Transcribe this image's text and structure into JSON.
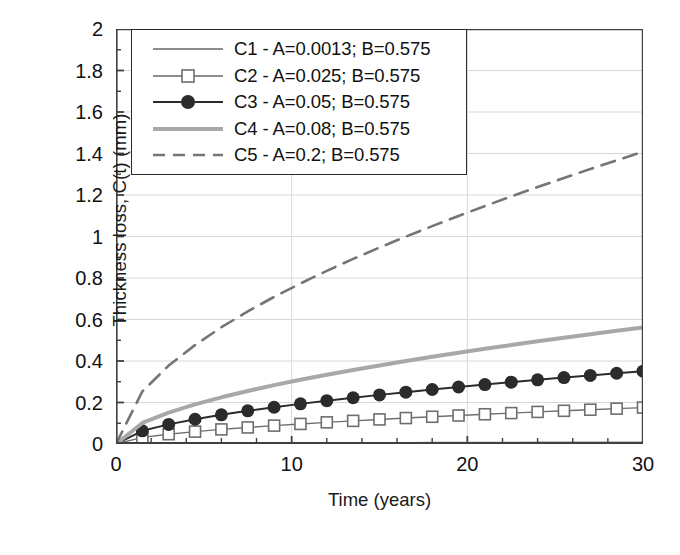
{
  "chart_data": {
    "type": "line",
    "title": "",
    "xlabel": "Time (years)",
    "ylabel": "Thickness loss, C(t) (mm)",
    "xlim": [
      0,
      30
    ],
    "ylim": [
      0,
      2
    ],
    "xticks": [
      0,
      10,
      20,
      30
    ],
    "xticklabels": [
      "0",
      "10",
      "20",
      "30"
    ],
    "xminor_step": 2,
    "yticks": [
      0,
      0.2,
      0.4,
      0.6,
      0.8,
      1,
      1.2,
      1.4,
      1.6,
      1.8,
      2
    ],
    "yticklabels": [
      "0",
      "0.2",
      "0.4",
      "0.6",
      "0.8",
      "1",
      "1.2",
      "1.4",
      "1.6",
      "1.8",
      "2"
    ],
    "yminor_step": 0.1,
    "grid": "horizontal gridlines at every 0.2; vertical gridlines at 10 and 20",
    "legend_position": "upper left inside axes",
    "model": "C(t) = A * t^B",
    "series": [
      {
        "name": "C1",
        "label": "C1 - A=0.0013; B=0.575",
        "A": 0.0013,
        "B": 0.575,
        "color": "#8c8c8c",
        "linewidth": 1.6,
        "dash": "none",
        "marker": "none",
        "x": [
          0,
          1.5,
          3,
          4.5,
          6,
          7.5,
          9,
          10.5,
          12,
          13.5,
          15,
          16.5,
          18,
          19.5,
          21,
          22.5,
          24,
          25.5,
          27,
          28.5,
          30
        ],
        "y": [
          0,
          0.0016,
          0.0024,
          0.0031,
          0.0036,
          0.0041,
          0.0045,
          0.0049,
          0.0053,
          0.0056,
          0.006,
          0.0063,
          0.0066,
          0.0069,
          0.0072,
          0.0074,
          0.0077,
          0.008,
          0.0082,
          0.0084,
          0.0087
        ]
      },
      {
        "name": "C2",
        "label": "C2 - A=0.025; B=0.575",
        "A": 0.025,
        "B": 0.575,
        "color": "#6e6e6e",
        "linewidth": 1.4,
        "dash": "none",
        "marker": "open-square",
        "x": [
          0,
          1.5,
          3,
          4.5,
          6,
          7.5,
          9,
          10.5,
          12,
          13.5,
          15,
          16.5,
          18,
          19.5,
          21,
          22.5,
          24,
          25.5,
          27,
          28.5,
          30
        ],
        "y": [
          0,
          0.0317,
          0.0473,
          0.0596,
          0.0703,
          0.0798,
          0.0886,
          0.0967,
          0.1043,
          0.1115,
          0.1184,
          0.125,
          0.1313,
          0.1374,
          0.1433,
          0.149,
          0.1546,
          0.16,
          0.1652,
          0.1704,
          0.1754
        ]
      },
      {
        "name": "C3",
        "label": "C3 -  A=0.05; B=0.575",
        "A": 0.05,
        "B": 0.575,
        "color": "#2b2b2b",
        "linewidth": 2.0,
        "dash": "none",
        "marker": "filled-circle",
        "x": [
          0,
          1.5,
          3,
          4.5,
          6,
          7.5,
          9,
          10.5,
          12,
          13.5,
          15,
          16.5,
          18,
          19.5,
          21,
          22.5,
          24,
          25.5,
          27,
          28.5,
          30
        ],
        "y": [
          0,
          0.0634,
          0.0945,
          0.1192,
          0.1406,
          0.1597,
          0.1772,
          0.1934,
          0.2086,
          0.223,
          0.2367,
          0.2499,
          0.2626,
          0.2748,
          0.2866,
          0.2981,
          0.3092,
          0.3201,
          0.3307,
          0.341,
          0.3511
        ]
      },
      {
        "name": "C4",
        "label": "C4 - A=0.08; B=0.575",
        "A": 0.08,
        "B": 0.575,
        "color": "#a8a8a8",
        "linewidth": 4.0,
        "dash": "none",
        "marker": "none",
        "x": [
          0,
          1.5,
          3,
          4.5,
          6,
          7.5,
          9,
          10.5,
          12,
          13.5,
          15,
          16.5,
          18,
          19.5,
          21,
          22.5,
          24,
          25.5,
          27,
          28.5,
          30
        ],
        "y": [
          0,
          0.1014,
          0.1512,
          0.1907,
          0.225,
          0.2556,
          0.2836,
          0.3095,
          0.3338,
          0.3568,
          0.3787,
          0.3998,
          0.4201,
          0.4397,
          0.4586,
          0.477,
          0.4948,
          0.5122,
          0.5291,
          0.5457,
          0.5618
        ]
      },
      {
        "name": "C5",
        "label": "C5 - A=0.2; B=0.575",
        "A": 0.2,
        "B": 0.575,
        "color": "#757575",
        "linewidth": 2.6,
        "dash": "14,9",
        "marker": "none",
        "x": [
          0,
          1.5,
          3,
          4.5,
          6,
          7.5,
          9,
          10.5,
          12,
          13.5,
          15,
          16.5,
          18,
          19.5,
          21,
          22.5,
          24,
          25.5,
          27,
          28.5,
          30
        ],
        "y": [
          0,
          0.2535,
          0.3779,
          0.4767,
          0.5625,
          0.639,
          0.7089,
          0.7737,
          0.8344,
          0.8919,
          0.9467,
          0.9994,
          1.0501,
          1.0992,
          1.1467,
          1.193,
          1.2381,
          1.282,
          1.325,
          1.367,
          1.4082
        ]
      }
    ]
  },
  "legend": {
    "items": [
      {
        "label": "C1 - A=0.0013; B=0.575"
      },
      {
        "label": "C2 - A=0.025; B=0.575"
      },
      {
        "label": "C3 -  A=0.05; B=0.575"
      },
      {
        "label": "C4 - A=0.08; B=0.575"
      },
      {
        "label": "C5 - A=0.2; B=0.575"
      }
    ]
  },
  "axes": {
    "x_title": "Time (years)",
    "y_title": "Thickness loss, C(t) (mm)",
    "x_labels": [
      "0",
      "10",
      "20",
      "30"
    ],
    "y_labels": [
      "0",
      "0.2",
      "0.4",
      "0.6",
      "0.8",
      "1",
      "1.2",
      "1.4",
      "1.6",
      "1.8",
      "2"
    ]
  },
  "colors": {
    "axis": "#404040",
    "grid": "#d8d8d8",
    "text": "#111111",
    "c1": "#8c8c8c",
    "c2": "#6e6e6e",
    "c3": "#2b2b2b",
    "c4": "#a8a8a8",
    "c5": "#757575"
  }
}
